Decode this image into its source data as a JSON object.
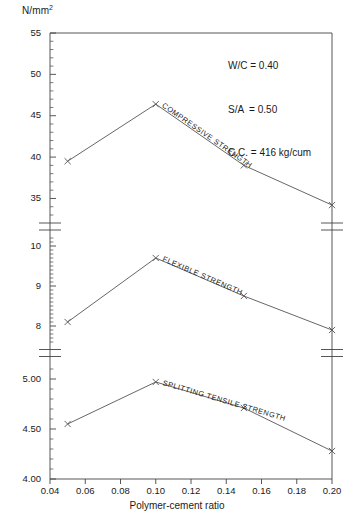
{
  "chart_data": {
    "type": "line",
    "title": "",
    "xlabel": "Polymer-cement ratio",
    "ylabel": "N/mm2",
    "ylabel_display": "N/mm",
    "ylabel_sup": "2",
    "x": [
      0.05,
      0.1,
      0.15,
      0.2
    ],
    "xlim": [
      0.04,
      0.2
    ],
    "xticks": [
      "0.04",
      "0.06",
      "0.08",
      "0.10",
      "0.12",
      "0.14",
      "0.16",
      "0.18",
      "0.20"
    ],
    "xtick_values": [
      0.04,
      0.06,
      0.08,
      0.1,
      0.12,
      0.14,
      0.16,
      0.18,
      0.2
    ],
    "grid": false,
    "legend": "inline-labels",
    "broken_axis": true,
    "marker": "x",
    "panels": [
      {
        "name": "compressive",
        "series_label": "COMPRESSIVE STRENGTH",
        "ylim": [
          33,
          55
        ],
        "yticks": [
          "55",
          "50",
          "45",
          "40",
          "35"
        ],
        "ytick_values": [
          55,
          50,
          45,
          40,
          35
        ],
        "minor_tick_step": 1,
        "values": [
          39.5,
          46.4,
          39.0,
          34.2
        ]
      },
      {
        "name": "flexible",
        "series_label": "FLEXIBLE STRENGTH",
        "ylim": [
          7.6,
          10.2
        ],
        "yticks": [
          "10",
          "9",
          "8"
        ],
        "ytick_values": [
          10,
          9,
          8
        ],
        "minor_tick_step": 0.1,
        "values": [
          8.1,
          9.7,
          8.75,
          7.9
        ]
      },
      {
        "name": "splitting-tensile",
        "series_label": "SPLITTING TENSILE STRENGTH",
        "ylim": [
          4.0,
          5.15
        ],
        "yticks": [
          "5.00",
          "4.50",
          "4.00"
        ],
        "ytick_values": [
          5.0,
          4.5,
          4.0
        ],
        "minor_tick_step": 0.1,
        "values": [
          4.55,
          4.97,
          4.71,
          4.28
        ]
      }
    ],
    "annotations": [
      "W/C = 0.40",
      "S/A  = 0.50",
      "C.C. = 416 kg/cum"
    ],
    "colors": {
      "line": "#555555",
      "axis": "#444444",
      "text": "#1a1a1a",
      "background": "#ffffff"
    }
  }
}
